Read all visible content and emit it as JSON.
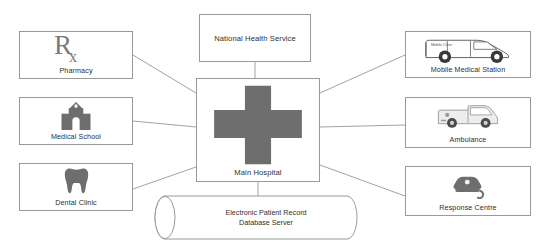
{
  "diagram": {
    "background": "#ffffff",
    "line_color": "#a3a3a3",
    "border_color": "#9a9a9a",
    "icon_color": "#6e6e6e",
    "text_color": "#2e2e2e",
    "center": {
      "name": "main-hospital",
      "label": "Main Hospital",
      "icon": "medical-cross-icon"
    },
    "nodes": [
      {
        "id": "pharmacy",
        "label": "Pharmacy",
        "icon": "rx-prescription-icon",
        "column": "left"
      },
      {
        "id": "medical-school",
        "label": "Medical School",
        "icon": "school-building-icon",
        "column": "left"
      },
      {
        "id": "dental-clinic",
        "label": "Dental Clinic",
        "icon": "tooth-icon",
        "column": "left"
      },
      {
        "id": "nhs",
        "label": "National Health Service",
        "icon": "none",
        "column": "top"
      },
      {
        "id": "mobile",
        "label": "Mobile Medical Station",
        "icon": "van-icon",
        "column": "right"
      },
      {
        "id": "ambulance",
        "label": "Ambulance",
        "icon": "ambulance-icon",
        "column": "right"
      },
      {
        "id": "response",
        "label": "Response Centre",
        "icon": "telephone-icon",
        "column": "right"
      },
      {
        "id": "database",
        "label": "Electronic Patient Record\nDatabase Server",
        "icon": "database-cylinder-icon",
        "column": "bottom"
      }
    ],
    "icon_text": {
      "rx_symbol": "Rx",
      "van_side_text": "Mobile Clinic"
    },
    "connections": [
      {
        "from": "pharmacy",
        "to": "main-hospital"
      },
      {
        "from": "medical-school",
        "to": "main-hospital"
      },
      {
        "from": "dental-clinic",
        "to": "main-hospital"
      },
      {
        "from": "nhs",
        "to": "main-hospital"
      },
      {
        "from": "mobile",
        "to": "main-hospital"
      },
      {
        "from": "ambulance",
        "to": "main-hospital"
      },
      {
        "from": "response",
        "to": "main-hospital"
      },
      {
        "from": "database",
        "to": "main-hospital"
      }
    ]
  }
}
